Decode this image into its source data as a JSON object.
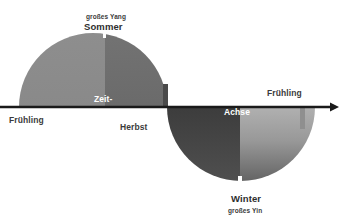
{
  "diagram": {
    "title_text_top_small": "großes Yang",
    "title_text_top": "Sommer",
    "title_text_bottom": "Winter",
    "title_text_bottom_small": "großes Yin",
    "axis_label_part1": "Zeit-",
    "axis_label_part2": "Achse",
    "label_spring_left": "Frühling",
    "label_autumn": "Herbst",
    "label_spring_right": "Frühling",
    "colors": {
      "background": "#ffffff",
      "axis_line": "#1a1a1a",
      "summer_light": "#8a8a8a",
      "summer_dark": "#6f6f6f",
      "winter_dark": "#3a3a3a",
      "winter_light_top": "#a6a6a6",
      "winter_light_bottom": "#6b6b6b",
      "label_text": "#3b3b3b",
      "overlay_text": "#ffffff"
    },
    "geometry": {
      "axis_y": 107,
      "center_x": 167,
      "radius": 74,
      "summer_center_x": 93,
      "winter_center_x": 241
    }
  }
}
